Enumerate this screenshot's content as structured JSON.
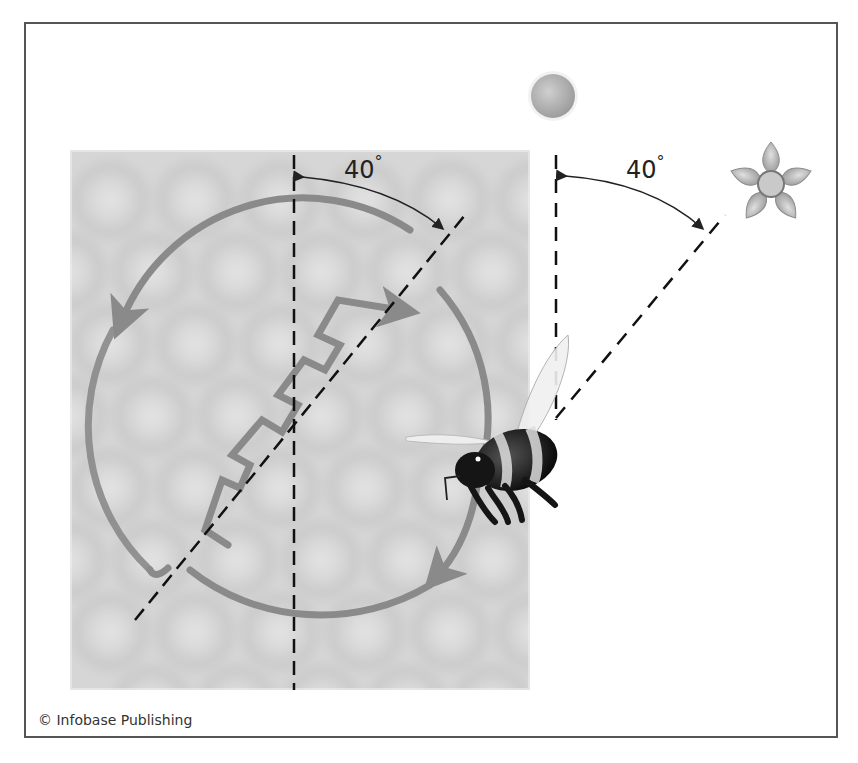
{
  "figure": {
    "comb_label": {
      "value": "40",
      "unit": "°"
    },
    "sky_label": {
      "value": "40",
      "unit": "°"
    },
    "credit": "© Infobase Publishing",
    "elements": {
      "sun": "sun-icon",
      "flower": "flower-icon",
      "bee": "bee-illustration",
      "honeycomb": "honeycomb-background",
      "waggle_dance": "waggle-dance-path"
    },
    "colors": {
      "frame": "#555555",
      "dance_path": "#8a8a8a",
      "comb_bg": "#d8d8d8",
      "comb_cell": "#c4c4c4",
      "sun": "#b5b5b5",
      "line": "#111111"
    }
  }
}
